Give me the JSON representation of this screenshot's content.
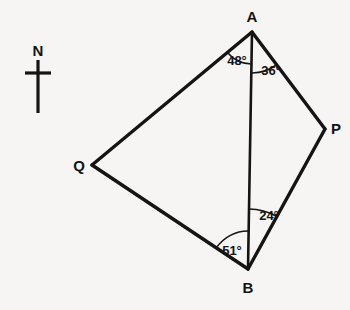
{
  "figure": {
    "canvas": {
      "width": 350,
      "height": 310
    },
    "background_color": "#f6f5f3",
    "stroke_color": "#141414",
    "outline_stroke_width": 3.4,
    "chord_stroke_width": 2.6,
    "arc_stroke_width": 1.6
  },
  "vertices": [
    {
      "id": "A",
      "label": "A",
      "x": 252,
      "y": 32,
      "label_x": 252,
      "label_y": 16
    },
    {
      "id": "P",
      "label": "P",
      "x": 325,
      "y": 129,
      "label_x": 336,
      "label_y": 128
    },
    {
      "id": "B",
      "label": "B",
      "x": 248,
      "y": 269,
      "label_x": 248,
      "label_y": 287
    },
    {
      "id": "Q",
      "label": "Q",
      "x": 92,
      "y": 165,
      "label_x": 79,
      "label_y": 165
    }
  ],
  "edges": [
    {
      "name": "edge-A-Q",
      "from": "A",
      "to": "Q",
      "kind": "outline"
    },
    {
      "name": "edge-Q-B",
      "from": "Q",
      "to": "B",
      "kind": "outline"
    },
    {
      "name": "edge-B-P",
      "from": "B",
      "to": "P",
      "kind": "outline"
    },
    {
      "name": "edge-P-A",
      "from": "P",
      "to": "A",
      "kind": "outline"
    },
    {
      "name": "edge-A-B",
      "from": "A",
      "to": "B",
      "kind": "chord"
    }
  ],
  "angles": [
    {
      "id": "angle-QAB",
      "value": "48°",
      "degrees": 48,
      "at_vertex": "A",
      "between": [
        "Q",
        "B"
      ],
      "label_x": 237,
      "label_y": 60,
      "arc_radius": 32
    },
    {
      "id": "angle-BAP",
      "value": "36°",
      "degrees": 36,
      "at_vertex": "A",
      "between": [
        "B",
        "P"
      ],
      "label_x": 271,
      "label_y": 70,
      "arc_radius": 41
    },
    {
      "id": "angle-ABP",
      "value": "24°",
      "degrees": 24,
      "at_vertex": "B",
      "between": [
        "A",
        "P"
      ],
      "label_x": 269,
      "label_y": 215,
      "arc_radius": 60
    },
    {
      "id": "angle-QBA",
      "value": "51°",
      "degrees": 51,
      "at_vertex": "B",
      "between": [
        "Q",
        "A"
      ],
      "label_x": 232,
      "label_y": 250,
      "arc_radius": 38
    }
  ],
  "north_marker": {
    "label": "N",
    "label_x": 38,
    "label_y": 50,
    "stem_x": 38,
    "stem_top_y": 60,
    "stem_bottom_y": 113,
    "crossbar_y": 73,
    "crossbar_left_x": 25,
    "crossbar_right_x": 51,
    "stem_width": 3.2,
    "crossbar_width": 3.2
  }
}
